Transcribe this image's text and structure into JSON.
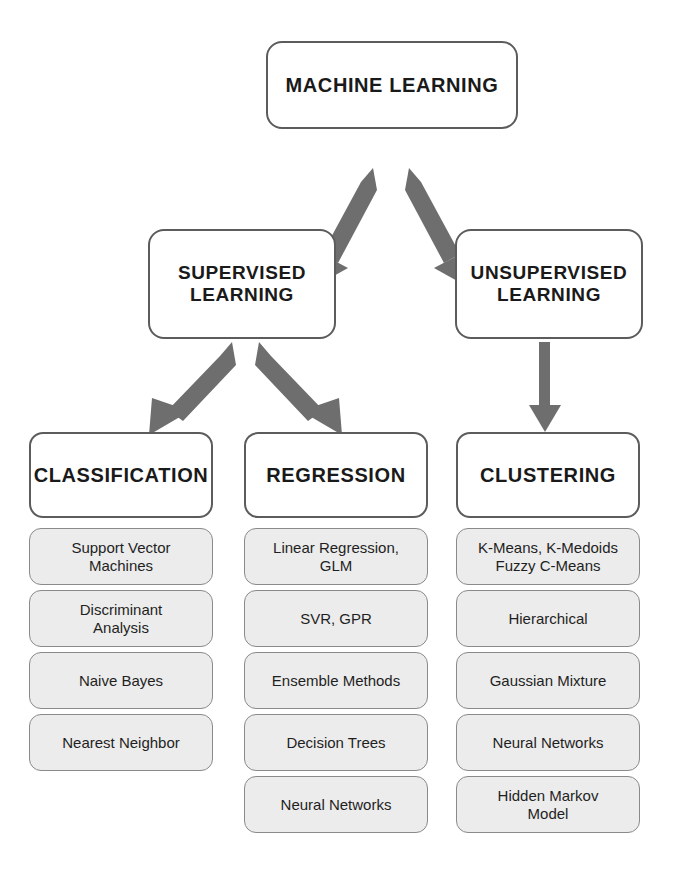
{
  "diagram": {
    "root": {
      "label": "MACHINE LEARNING"
    },
    "level2": [
      {
        "label": "SUPERVISED\nLEARNING"
      },
      {
        "label": "UNSUPERVISED\nLEARNING"
      }
    ],
    "columns": [
      {
        "heading": "CLASSIFICATION",
        "items": [
          "Support Vector\nMachines",
          "Discriminant\nAnalysis",
          "Naive Bayes",
          "Nearest Neighbor"
        ]
      },
      {
        "heading": "REGRESSION",
        "items": [
          "Linear Regression,\nGLM",
          "SVR, GPR",
          "Ensemble Methods",
          "Decision Trees",
          "Neural Networks"
        ]
      },
      {
        "heading": "CLUSTERING",
        "items": [
          "K-Means, K-Medoids\nFuzzy C-Means",
          "Hierarchical",
          "Gaussian Mixture",
          "Neural Networks",
          "Hidden Markov\nModel"
        ]
      }
    ],
    "arrows": [
      {
        "name": "arrow-ml-to-supervised",
        "direction": "down-left"
      },
      {
        "name": "arrow-ml-to-unsupervised",
        "direction": "down-right"
      },
      {
        "name": "arrow-supervised-to-classification",
        "direction": "down-left"
      },
      {
        "name": "arrow-supervised-to-regression",
        "direction": "down-right"
      },
      {
        "name": "arrow-unsupervised-to-clustering",
        "direction": "down"
      }
    ],
    "colors": {
      "node_border": "#5c5c5c",
      "node_fill": "#ffffff",
      "leaf_border": "#8a8a8a",
      "leaf_fill": "#ececec",
      "arrow": "#6e6e6e",
      "text": "#1a1a1a",
      "background": "#ffffff"
    }
  }
}
